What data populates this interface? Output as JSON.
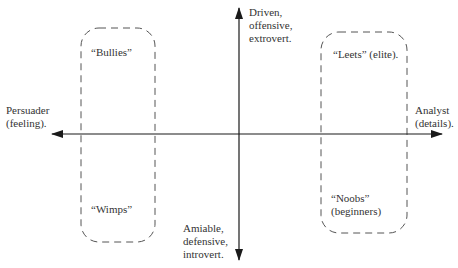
{
  "diagram": {
    "type": "quadrant-matrix",
    "colors": {
      "axis": "#1a1a1a",
      "box_border": "#555555",
      "text": "#333333",
      "background": "#ffffff"
    },
    "axes": {
      "horizontal": {
        "left_label": "Persuader\n(feeling).",
        "right_label": "Analyst\n(details)."
      },
      "vertical": {
        "top_label": "Driven,\noffensive,\nextrovert.",
        "bottom_label": "Amiable,\ndefensive,\nintrovert."
      }
    },
    "groups": [
      {
        "id": "left",
        "top_label": "“Bullies”",
        "bottom_label": "“Wimps”"
      },
      {
        "id": "right",
        "top_label": "“Leets” (elite).",
        "bottom_label": "“Noobs”\n(beginners)"
      }
    ]
  }
}
